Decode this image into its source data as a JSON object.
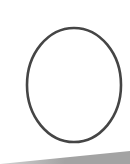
{
  "drawing": {
    "oval": {
      "cx": 74,
      "cy": 85,
      "rx": 47,
      "ry": 57,
      "stroke": "#454545",
      "stroke_width": 2.6,
      "fill": "#ffffff"
    },
    "floor_band": {
      "points": "0,164 130,151 130,164",
      "color_light": "#d2d2d2",
      "color_dark": "#a3a3a3"
    },
    "background": "#ffffff"
  }
}
